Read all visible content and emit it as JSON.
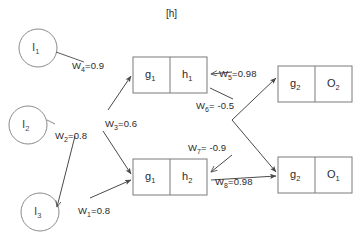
{
  "title": "[h]",
  "diagram": {
    "type": "neural-network",
    "inputs": [
      {
        "id": "I1",
        "label": "I",
        "sub": "1",
        "cx": 38,
        "cy": 48,
        "r": 19
      },
      {
        "id": "I2",
        "label": "I",
        "sub": "2",
        "cx": 28,
        "cy": 125,
        "r": 19
      },
      {
        "id": "I3",
        "label": "I",
        "sub": "3",
        "cx": 40,
        "cy": 212,
        "r": 19
      }
    ],
    "hidden": [
      {
        "id": "H1",
        "left_label": "g",
        "left_sub": "1",
        "right_label": "h",
        "right_sub": "1",
        "x": 133,
        "y": 57,
        "w": 74,
        "h": 36
      },
      {
        "id": "H2",
        "left_label": "g",
        "left_sub": "1",
        "right_label": "h",
        "right_sub": "2",
        "x": 133,
        "y": 159,
        "w": 74,
        "h": 36
      }
    ],
    "outputs": [
      {
        "id": "O2",
        "left_label": "g",
        "left_sub": "2",
        "right_label": "O",
        "right_sub": "2",
        "x": 278,
        "y": 66,
        "w": 74,
        "h": 36
      },
      {
        "id": "O1",
        "left_label": "g",
        "left_sub": "2",
        "right_label": "O",
        "right_sub": "1",
        "x": 278,
        "y": 157,
        "w": 74,
        "h": 36
      }
    ],
    "weights": [
      {
        "id": "W1",
        "name": "W",
        "sub": "1",
        "eq": "=0.8",
        "value": 0.8,
        "x": 78,
        "y": 205
      },
      {
        "id": "W2",
        "name": "W",
        "sub": "2",
        "eq": "=0.8",
        "value": 0.8,
        "x": 55,
        "y": 130
      },
      {
        "id": "W3",
        "name": "W",
        "sub": "3",
        "eq": "=0.6",
        "value": 0.6,
        "x": 105,
        "y": 118
      },
      {
        "id": "W4",
        "name": "W",
        "sub": "4",
        "eq": "=0.9",
        "value": 0.9,
        "x": 72,
        "y": 60
      },
      {
        "id": "W5",
        "name": "W",
        "sub": "5",
        "eq": "=0.98",
        "value": 0.98,
        "x": 219,
        "y": 68
      },
      {
        "id": "W6",
        "name": "W",
        "sub": "6",
        "eq": "= -0.5",
        "value": -0.5,
        "x": 196,
        "y": 100
      },
      {
        "id": "W7",
        "name": "W",
        "sub": "7",
        "eq": "= -0.9",
        "value": -0.9,
        "x": 188,
        "y": 142
      },
      {
        "id": "W8",
        "name": "W",
        "sub": "8",
        "eq": "=0.98",
        "value": 0.98,
        "x": 215,
        "y": 176
      }
    ],
    "colors": {
      "stroke": "#555555",
      "circle_stroke": "#8a8a8a",
      "box_stroke": "#7a7a7a",
      "text": "#2b2b2b",
      "background": "#ffffff"
    }
  }
}
